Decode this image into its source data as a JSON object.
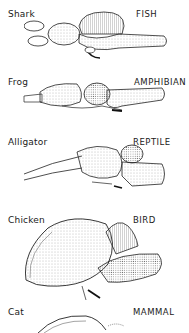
{
  "figure": {
    "rows": [
      {
        "species": "Shark",
        "class": "FISH"
      },
      {
        "species": "Frog",
        "class": "AMPHIBIAN"
      },
      {
        "species": "Alligator",
        "class": "REPTILE"
      },
      {
        "species": "Chicken",
        "class": "BIRD"
      },
      {
        "species": "Cat",
        "class": "MAMMAL"
      }
    ]
  },
  "colors": {
    "ink": "#1a1a1a",
    "stipple": "#888888",
    "shade": "#bbbbbb",
    "background": "#ffffff"
  }
}
